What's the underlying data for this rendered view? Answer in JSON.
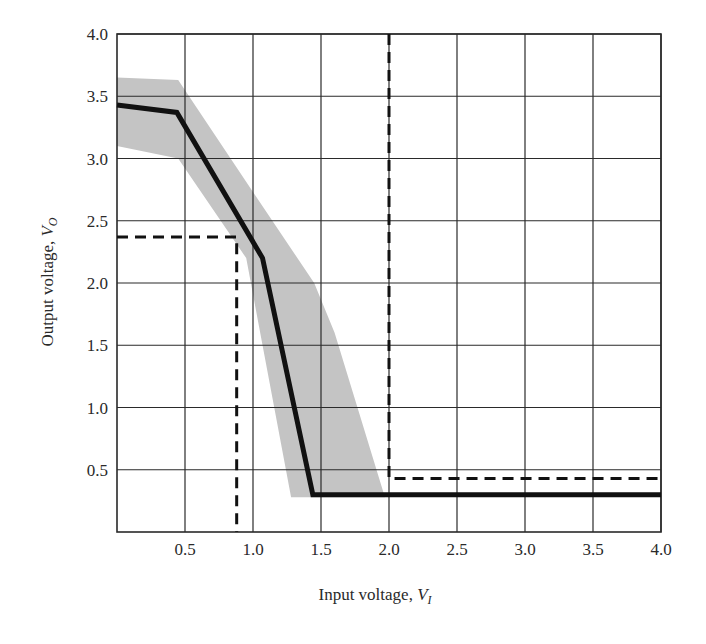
{
  "chart_data": {
    "type": "line",
    "title": "",
    "xlabel": "Input voltage, V_I",
    "ylabel": "Output voltage, V_O",
    "xlabel_main": "Input voltage, ",
    "xlabel_var": "V",
    "xlabel_sub": "I",
    "ylabel_main": "Output voltage, ",
    "ylabel_var": "V",
    "ylabel_sub": "O",
    "xlim": [
      0,
      4.0
    ],
    "ylim": [
      0,
      4.0
    ],
    "grid": true,
    "x_ticks": [
      "0.5",
      "1.0",
      "1.5",
      "2.0",
      "2.5",
      "3.0",
      "3.5",
      "4.0"
    ],
    "y_ticks": [
      "0.5",
      "1.0",
      "1.5",
      "2.0",
      "2.5",
      "3.0",
      "3.5",
      "4.0"
    ],
    "series": [
      {
        "name": "typical transfer curve",
        "style": "solid-thick",
        "color": "#111111",
        "x": [
          0.0,
          0.44,
          1.07,
          1.44,
          4.0
        ],
        "y": [
          3.43,
          3.37,
          2.2,
          0.3,
          0.3
        ]
      },
      {
        "name": "input low threshold (V_IL)",
        "style": "dashed",
        "color": "#111111",
        "x": [
          0.0,
          0.88,
          0.88
        ],
        "y": [
          2.37,
          2.37,
          0.0
        ]
      },
      {
        "name": "input high threshold (V_IH)",
        "style": "dashed",
        "color": "#111111",
        "x": [
          2.0,
          2.0,
          4.0
        ],
        "y": [
          4.0,
          0.43,
          0.43
        ]
      }
    ],
    "bands": [
      {
        "name": "spread of transfer characteristics",
        "color": "#c4c4c4",
        "polygon_x": [
          0.0,
          0.45,
          1.0,
          1.45,
          1.6,
          1.97,
          1.28,
          0.95,
          0.45,
          0.0
        ],
        "polygon_y": [
          3.65,
          3.63,
          2.73,
          2.0,
          1.6,
          0.28,
          0.28,
          2.2,
          3.0,
          3.1
        ]
      }
    ]
  }
}
